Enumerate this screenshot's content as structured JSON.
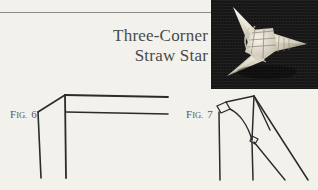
{
  "page": {
    "background_color": "#f3f1ec",
    "rule_color": "#8d8b86"
  },
  "title": {
    "line1": "Three-Corner",
    "line2": "Straw Star",
    "color": "#4a4a4a"
  },
  "photo": {
    "alt": "Three-corner straw star ornament on dark cloth",
    "background_color": "#161616",
    "straw_color": "#e8e4d8"
  },
  "figures": [
    {
      "id": "fig6",
      "prefix": "F",
      "small": "IG",
      "separator": ".",
      "number": "6",
      "label_full": "Fig. 6"
    },
    {
      "id": "fig7",
      "prefix": "F",
      "small": "IG",
      "separator": ".",
      "number": "7",
      "label_full": "Fig. 7"
    }
  ],
  "line_art": {
    "stroke_color": "#2b2b2b"
  }
}
